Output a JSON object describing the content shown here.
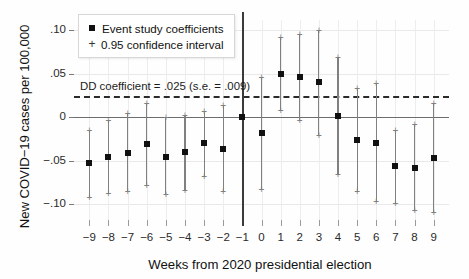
{
  "chart_data": {
    "type": "scatter",
    "title": "",
    "xlabel": "Weeks from 2020 presidential election",
    "ylabel": "New COVID−19 cases per 100,000",
    "xlim": [
      -9.8,
      9.8
    ],
    "ylim": [
      -0.118,
      0.112
    ],
    "grid": true,
    "legend_position": "top-left",
    "x_ticks": [
      "−9",
      "−8",
      "−7",
      "−6",
      "−5",
      "−4",
      "−3",
      "−2",
      "−1",
      "0",
      "1",
      "2",
      "3",
      "4",
      "5",
      "6",
      "7",
      "8",
      "9"
    ],
    "y_ticks": [
      ".10",
      ".05",
      "0",
      "−.05",
      "−.10"
    ],
    "y_tick_values": [
      0.1,
      0.05,
      0,
      -0.05,
      -0.1
    ],
    "reference_period": -1,
    "series": [
      {
        "name": "Event study coefficients",
        "marker": "square",
        "x": [
          -9,
          -8,
          -7,
          -6,
          -5,
          -4,
          -3,
          -2,
          -1,
          0,
          1,
          2,
          3,
          4,
          5,
          6,
          7,
          8,
          9
        ],
        "values": [
          -0.053,
          -0.046,
          -0.041,
          -0.031,
          -0.045,
          -0.04,
          -0.03,
          -0.036,
          0.0,
          -0.018,
          0.05,
          0.046,
          0.041,
          0.002,
          -0.026,
          -0.029,
          -0.056,
          -0.058,
          -0.047
        ],
        "ci_low": [
          -0.092,
          -0.087,
          -0.085,
          -0.078,
          -0.088,
          -0.084,
          -0.067,
          -0.085,
          null,
          -0.082,
          0.008,
          -0.003,
          -0.02,
          -0.065,
          -0.085,
          -0.096,
          -0.098,
          -0.106,
          -0.109
        ],
        "ci_high": [
          -0.014,
          -0.003,
          0.005,
          0.017,
          0.001,
          0.003,
          0.007,
          0.014,
          null,
          0.046,
          0.093,
          0.096,
          0.1,
          0.069,
          0.034,
          0.04,
          -0.014,
          -0.008,
          0.017
        ]
      }
    ],
    "legend": [
      {
        "label": "Event study coefficients",
        "marker": "square"
      },
      {
        "label": "0.95 confidence interval",
        "marker": "plus"
      }
    ],
    "annotations": [
      {
        "text": "DD coefficient = .025 (s.e. = .009)",
        "line_style": "dashed",
        "y_value": 0.025
      }
    ]
  }
}
